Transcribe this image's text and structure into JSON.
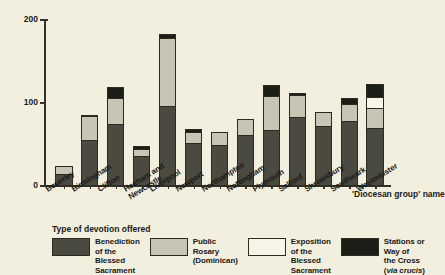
{
  "chart_data": {
    "type": "bar",
    "subtype": "stacked-vertical",
    "title": "",
    "xlabel": "'Diocesan group' name",
    "ylabel": "Proportion of churches, expressed\nas a percentage",
    "ylim": [
      0,
      200
    ],
    "yticks": [
      0,
      100,
      200
    ],
    "ytick_labels": [
      "0",
      "100",
      "200"
    ],
    "grid": false,
    "legend_position": "below-axis",
    "legend_title": "Type of devotion offered",
    "categories": [
      "Beverley",
      "Birmingham",
      "Clifton",
      "Hexham and\nNewcastle",
      "Liverpool",
      "Newport",
      "Northampton",
      "Nottingham",
      "Plymouth",
      "Salford",
      "Shrewsbury",
      "Southwark",
      "Westminster"
    ],
    "series": [
      {
        "name": "Benediction of the\nBlessed Sacrament",
        "color": "#4b4a41",
        "key": "benediction",
        "values": [
          15,
          55,
          75,
          36,
          97,
          52,
          50,
          62,
          68,
          83,
          72,
          78,
          70
        ]
      },
      {
        "name": "Public Rosary\n(Dominican)",
        "color": "#c8c5b4",
        "key": "rosary",
        "values": [
          10,
          30,
          32,
          10,
          82,
          14,
          16,
          20,
          42,
          28,
          18,
          22,
          25
        ]
      },
      {
        "name": "Exposition of the\nBlessed Sacrament",
        "color": "#f7f5e8",
        "key": "exposition",
        "values": [
          0,
          0,
          0,
          0,
          0,
          0,
          0,
          0,
          0,
          0,
          0,
          0,
          15
        ]
      },
      {
        "name": "Stations or Way of\nthe Cross (via crucis)",
        "color": "#1d1d17",
        "key": "stations",
        "values": [
          0,
          3,
          15,
          5,
          7,
          5,
          0,
          0,
          14,
          4,
          0,
          8,
          17
        ]
      }
    ],
    "totals": [
      25,
      88,
      122,
      51,
      186,
      71,
      66,
      82,
      124,
      115,
      90,
      108,
      127
    ]
  },
  "legend": {
    "title": "Type of devotion offered",
    "items": [
      {
        "key": "benediction",
        "label": "Benediction of the\nBlessed Sacrament"
      },
      {
        "key": "rosary",
        "label": "Public Rosary\n(Dominican)"
      },
      {
        "key": "exposition",
        "label": "Exposition of the\nBlessed Sacrament"
      },
      {
        "key": "stations",
        "label": "Stations or Way of\nthe Cross (via crucis)"
      }
    ]
  },
  "axes": {
    "y_title": "Proportion of churches, expressed\nas a percentage",
    "x_title": "'Diocesan group' name"
  }
}
